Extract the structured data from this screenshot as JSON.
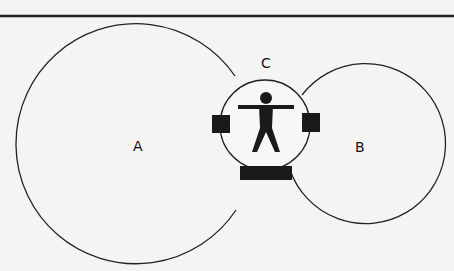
{
  "diagram": {
    "labels": {
      "a": "A",
      "b": "B",
      "c": "C"
    },
    "colors": {
      "background": "#f4f4f2",
      "stroke": "#222222",
      "fill_dark": "#1a1a1a"
    }
  }
}
